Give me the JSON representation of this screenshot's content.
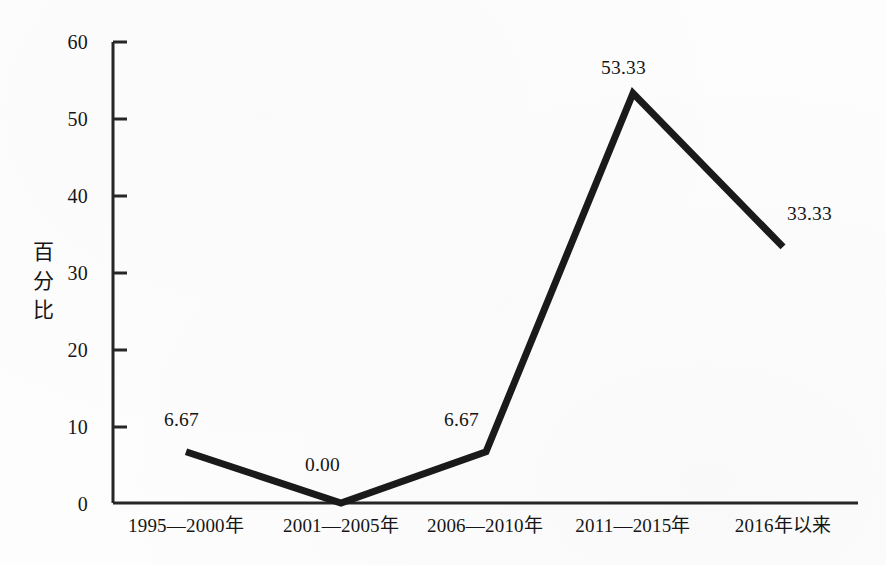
{
  "chart_data": {
    "type": "line",
    "title": "",
    "subtitle": "",
    "xlabel": "",
    "ylabel": "百分比",
    "ylabel_chars": [
      "百",
      "分",
      "比"
    ],
    "categories": [
      "1995—2000年",
      "2001—2005年",
      "2006—2010年",
      "2011—2015年",
      "2016年以来"
    ],
    "values": [
      6.67,
      0.0,
      6.67,
      53.33,
      33.33
    ],
    "value_labels": [
      "6.67",
      "0.00",
      "6.67",
      "53.33",
      "33.33"
    ],
    "ylim": [
      0,
      60
    ],
    "ytick_labels": [
      "0",
      "10",
      "20",
      "30",
      "40",
      "50",
      "60"
    ],
    "ytick_values": [
      0,
      10,
      20,
      30,
      40,
      50,
      60
    ],
    "grid": false,
    "legend": null,
    "legend_position": "none",
    "series": [
      {
        "name": "百分比",
        "values": [
          6.67,
          0.0,
          6.67,
          53.33,
          33.33
        ],
        "color": "#1a1a1a",
        "line_width": 7,
        "markers": false
      }
    ],
    "axis_color": "#262626",
    "tick_direction": "in"
  },
  "figure": {
    "background_color": "#fdfdfd"
  }
}
